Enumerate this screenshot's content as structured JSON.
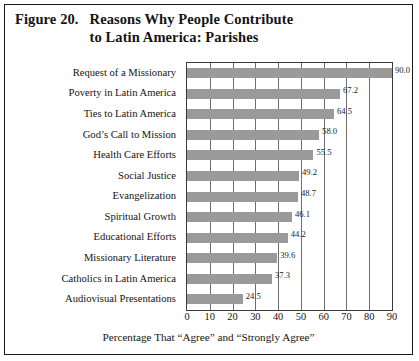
{
  "figure": {
    "number": "Figure 20.",
    "caption_line1": "Reasons Why People Contribute",
    "caption_line2": "to Latin America: Parishes"
  },
  "chart_data": {
    "type": "bar",
    "orientation": "horizontal",
    "title": "Figure 20. Reasons Why People Contribute to Latin America: Parishes",
    "xlabel": "Percentage That “Agree” and “Strongly Agree”",
    "ylabel": "",
    "xlim": [
      0,
      90
    ],
    "xticks": [
      "0",
      "10",
      "20",
      "30",
      "40",
      "50",
      "60",
      "70",
      "80",
      "90"
    ],
    "xtick_values": [
      0,
      10,
      20,
      30,
      40,
      50,
      60,
      70,
      80,
      90
    ],
    "grid": "vertical",
    "legend": "none",
    "bar_color": "#9a9a9a",
    "categories": [
      "Request of a Missionary",
      "Poverty in Latin America",
      "Ties to Latin America",
      "God’s Call to Mission",
      "Health Care Efforts",
      "Social Justice",
      "Evangelization",
      "Spiritual Growth",
      "Educational Efforts",
      "Missionary Literature",
      "Catholics in Latin America",
      "Audiovisual Presentations"
    ],
    "values": [
      90.0,
      67.2,
      64.5,
      58.0,
      55.5,
      49.2,
      48.7,
      46.1,
      44.2,
      39.6,
      37.3,
      24.5
    ],
    "value_labels": [
      "90.0",
      "67.2",
      "64.5",
      "58.0",
      "55.5",
      "49.2",
      "48.7",
      "46.1",
      "44.2",
      "39.6",
      "37.3",
      "24.5"
    ]
  }
}
